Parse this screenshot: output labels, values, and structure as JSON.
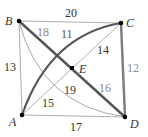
{
  "diagram": {
    "type": "weighted-graph",
    "vertices": [
      {
        "id": "A",
        "label": "A",
        "x": 22,
        "y": 115
      },
      {
        "id": "B",
        "label": "B",
        "x": 19,
        "y": 21
      },
      {
        "id": "C",
        "label": "C",
        "x": 121,
        "y": 23
      },
      {
        "id": "D",
        "label": "D",
        "x": 125,
        "y": 117
      },
      {
        "id": "E",
        "label": "E",
        "x": 72,
        "y": 68
      }
    ],
    "edges": [
      {
        "from": "B",
        "to": "C",
        "weight": "20",
        "style": "thin"
      },
      {
        "from": "B",
        "to": "A",
        "weight": "13",
        "style": "thin"
      },
      {
        "from": "A",
        "to": "D",
        "weight": "17",
        "style": "thin"
      },
      {
        "from": "C",
        "to": "D",
        "weight": "12",
        "style": "thick-gray"
      },
      {
        "from": "B",
        "to": "E",
        "weight": "18",
        "style": "thick-dark"
      },
      {
        "from": "E",
        "to": "D",
        "weight": "16",
        "style": "thick-dark"
      },
      {
        "from": "A",
        "to": "E",
        "weight": "15",
        "style": "thin"
      },
      {
        "from": "E",
        "to": "C",
        "weight": "14",
        "style": "thin"
      },
      {
        "from": "A",
        "to": "C",
        "weight": "11",
        "style": "thick-curved"
      },
      {
        "from": "B",
        "to": "D",
        "weight": "19",
        "style": "thin-curved"
      }
    ],
    "colors": {
      "thin_edge": "#b0b0b0",
      "thick_dark_edge": "#555555",
      "thick_gray_edge": "#7a7a7a",
      "vertex": "#000000",
      "label_dark": "#333333",
      "label_light": "#888888"
    }
  }
}
